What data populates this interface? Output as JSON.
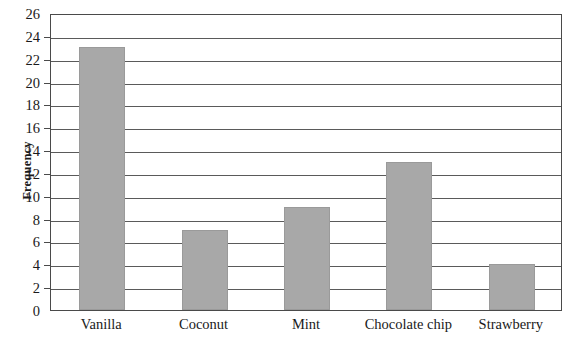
{
  "chart_data": {
    "type": "bar",
    "title": "",
    "xlabel": "",
    "ylabel": "Frequency",
    "categories": [
      "Vanilla",
      "Coconut",
      "Mint",
      "Chocolate chip",
      "Strawberry"
    ],
    "values": [
      23,
      7,
      9,
      13,
      4
    ],
    "ylim": [
      0,
      26
    ],
    "y_ticks": [
      0,
      2,
      4,
      6,
      8,
      10,
      12,
      14,
      16,
      18,
      20,
      22,
      24,
      26
    ],
    "y_tick_labels": [
      "0",
      "2",
      "4",
      "6",
      "8",
      "10",
      "12",
      "14",
      "16",
      "18",
      "20",
      "22",
      "24",
      "26"
    ],
    "grid": true,
    "grid_axis": "y",
    "legend": false,
    "legend_position": "none",
    "bar_color": "#a8a8a8",
    "bar_edge_color": "#9a9a9a",
    "axis_color": "#4a4a4a",
    "grid_color": "#5a5a5a",
    "text_color": "#1a1a1a",
    "background_color": "#ffffff"
  }
}
